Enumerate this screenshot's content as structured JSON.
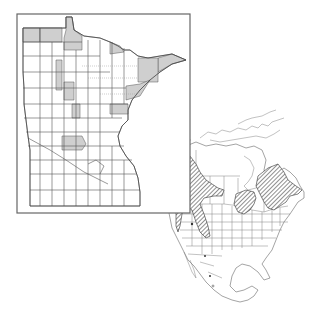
{
  "figure": {
    "type": "species-distribution-map",
    "panels": [
      {
        "id": "minnesota",
        "description": "Minnesota county map with shaded counties indicating occurrence",
        "frame": {
          "x": 17,
          "y": 14,
          "width": 173,
          "height": 199
        },
        "shaded_fill": "#cfcfcf",
        "shaded_regions": [
          "far-northwest-border-counties",
          "lake-of-the-woods-area",
          "northeast-arrowhead-lake-county",
          "northeast-cook-county",
          "st-louis-northeast",
          "koochiching-east-edge",
          "central-north-column-1",
          "central-north-column-2",
          "central-north-column-3",
          "east-central-aitkin-area",
          "central-stearns-area"
        ]
      },
      {
        "id": "north-america",
        "description": "North America outline with hatched range polygons",
        "hatch_pattern": "diagonal",
        "ranges": [
          "pacific-northwest-rockies",
          "central-ontario-great-lakes",
          "quebec-labrador-maritimes"
        ],
        "point_records": 4
      }
    ],
    "colors": {
      "background": "#ffffff",
      "outline": "#555555",
      "shaded": "#cfcfcf",
      "hatch": "#333333"
    }
  }
}
